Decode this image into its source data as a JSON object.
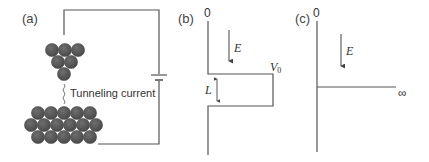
{
  "panels": {
    "a": {
      "label": "(a)",
      "annotation": "Tunneling current",
      "tip_atoms": [
        {
          "cx": 52,
          "cy": 50
        },
        {
          "cx": 65,
          "cy": 50
        },
        {
          "cx": 78,
          "cy": 50
        },
        {
          "cx": 58,
          "cy": 62
        },
        {
          "cx": 71,
          "cy": 62
        },
        {
          "cx": 64,
          "cy": 74
        }
      ],
      "surface_atoms": [
        {
          "cx": 38,
          "cy": 113
        },
        {
          "cx": 51,
          "cy": 113
        },
        {
          "cx": 64,
          "cy": 113
        },
        {
          "cx": 77,
          "cy": 113
        },
        {
          "cx": 90,
          "cy": 113
        },
        {
          "cx": 31,
          "cy": 125
        },
        {
          "cx": 44,
          "cy": 125
        },
        {
          "cx": 57,
          "cy": 125
        },
        {
          "cx": 70,
          "cy": 125
        },
        {
          "cx": 83,
          "cy": 125
        },
        {
          "cx": 96,
          "cy": 125
        },
        {
          "cx": 38,
          "cy": 137
        },
        {
          "cx": 51,
          "cy": 137
        },
        {
          "cx": 64,
          "cy": 137
        },
        {
          "cx": 77,
          "cy": 137
        },
        {
          "cx": 90,
          "cy": 137
        }
      ]
    },
    "b": {
      "label": "(b)",
      "zero_label": "0",
      "energy_label": "E",
      "barrier_label": "V",
      "barrier_subscript": "0",
      "width_label": "L"
    },
    "c": {
      "label": "(c)",
      "zero_label": "0",
      "energy_label": "E",
      "infinity_label": "∞"
    }
  },
  "colors": {
    "line": "#555555",
    "atom": "#555555",
    "text": "#333333"
  }
}
